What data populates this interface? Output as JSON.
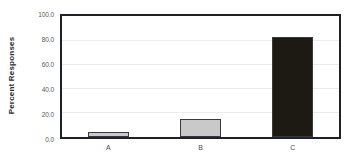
{
  "chart_data": {
    "type": "bar",
    "title": "",
    "xlabel": "",
    "ylabel": "Percent Responses",
    "categories": [
      "A",
      "B",
      "C"
    ],
    "values": [
      4.0,
      15.0,
      83.0
    ],
    "ylim": [
      0.0,
      100.0
    ],
    "ytick_labels": [
      "0.0",
      "20.0",
      "40.0",
      "60.0",
      "80.0",
      "100.0"
    ],
    "ytick_values": [
      0.0,
      20.0,
      40.0,
      60.0,
      80.0,
      100.0
    ],
    "grid": true,
    "legend": "none",
    "bar_colors": [
      "#c9c9c9",
      "#c9c9c9",
      "#1c1a12"
    ],
    "bar_edge_color": "#3a3a3a",
    "frame_color": "#201f2c",
    "gridline_color": "#ececec",
    "background": "#ffffff"
  }
}
